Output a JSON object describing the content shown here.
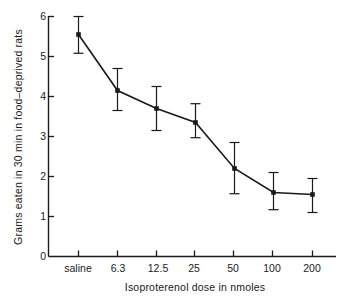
{
  "chart_data": {
    "type": "line",
    "title": "",
    "xlabel": "Isoproterenol  dose in nmoles",
    "ylabel": "Grams eaten in 30 min in food–deprived rats",
    "categories": [
      "saline",
      "6.3",
      "12.5",
      "25",
      "50",
      "100",
      "200"
    ],
    "values": [
      5.55,
      4.15,
      3.7,
      3.35,
      2.2,
      1.6,
      1.55
    ],
    "error_upper": [
      0.45,
      0.55,
      0.55,
      0.47,
      0.65,
      0.5,
      0.4
    ],
    "error_lower": [
      0.47,
      0.5,
      0.55,
      0.38,
      0.63,
      0.43,
      0.45
    ],
    "ylim": [
      0,
      6
    ],
    "yticks": [
      0,
      1,
      2,
      3,
      4,
      5,
      6
    ],
    "ytick_labels": [
      "0",
      "1",
      "2",
      "3",
      "4",
      "5",
      "6"
    ],
    "grid": false,
    "legend": "none",
    "series": [
      {
        "name": "mean grams eaten",
        "values": [
          5.55,
          4.15,
          3.7,
          3.35,
          2.2,
          1.6,
          1.55
        ]
      }
    ],
    "colors": {
      "line": "#1a1a1a",
      "marker": "#1a1a1a",
      "errorbar": "#1a1a1a",
      "axis": "#1a1a1a",
      "background": "#ffffff"
    }
  }
}
